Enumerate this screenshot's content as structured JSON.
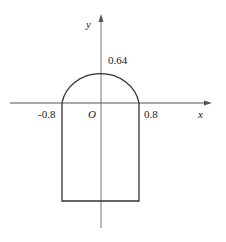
{
  "diagram": {
    "axes": {
      "x_label": "x",
      "y_label": "y",
      "origin_label": "O"
    },
    "tick_labels": {
      "x_neg": "-0.8",
      "x_pos": "0.8",
      "y_top": "0.64"
    },
    "shape": "rectangle with semicircular top (arch)",
    "colors": {
      "stroke": "#333333",
      "axis": "#555555",
      "background": "#ffffff"
    }
  }
}
